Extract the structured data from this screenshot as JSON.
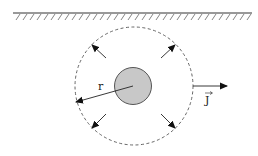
{
  "diagram": {
    "labels": {
      "radius": "r",
      "current_density": "J"
    },
    "colors": {
      "stroke": "#222222",
      "dashed": "#555555",
      "charge_fill": "#c8c8c8"
    }
  }
}
